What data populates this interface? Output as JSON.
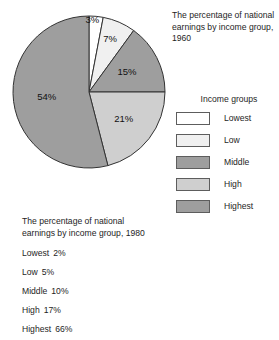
{
  "chart_data": {
    "type": "pie",
    "title": "The percentage of national earnings by income group, 1960",
    "categories": [
      "Lowest",
      "Low",
      "Middle",
      "High",
      "Highest"
    ],
    "values": [
      3,
      7,
      15,
      21,
      54
    ],
    "value_labels": [
      "3%",
      "7%",
      "15%",
      "21%",
      "54%"
    ],
    "unit": "%",
    "start_angle_deg": 0,
    "direction": "clockwise",
    "legend_position": "right",
    "grid": false,
    "colors": [
      "#ffffff",
      "#f0f0f0",
      "#9e9e9e",
      "#cfcfcf",
      "#9e9e9e"
    ],
    "stroke": "#333333",
    "companion_table": {
      "title": "The percentage of national earnings by income group, 1980",
      "type": "table",
      "categories": [
        "Lowest",
        "Low",
        "Middle",
        "High",
        "Highest"
      ],
      "values": [
        2,
        5,
        10,
        17,
        66
      ],
      "value_labels": [
        "2%",
        "5%",
        "10%",
        "17%",
        "66%"
      ]
    }
  },
  "pie": {
    "slices": [
      {
        "label": "3%",
        "value": 3,
        "color": "#ffffff",
        "group": "Lowest"
      },
      {
        "label": "7%",
        "value": 7,
        "color": "#f0f0f0",
        "group": "Low"
      },
      {
        "label": "15%",
        "value": 15,
        "color": "#9e9e9e",
        "group": "Middle"
      },
      {
        "label": "21%",
        "value": 21,
        "color": "#cfcfcf",
        "group": "High"
      },
      {
        "label": "54%",
        "value": 54,
        "color": "#9e9e9e",
        "group": "Highest"
      }
    ]
  },
  "caption_1960": {
    "line1": "The percentage of national",
    "line2": "earnings by income group,",
    "line3": "1960"
  },
  "legend": {
    "title": "Income groups",
    "items": [
      {
        "label": "Lowest",
        "color": "#ffffff"
      },
      {
        "label": "Low",
        "color": "#f0f0f0"
      },
      {
        "label": "Middle",
        "color": "#9e9e9e"
      },
      {
        "label": "High",
        "color": "#cfcfcf"
      },
      {
        "label": "Highest",
        "color": "#9e9e9e"
      }
    ]
  },
  "block_1980": {
    "caption_line1": "The percentage of national",
    "caption_line2": "earnings by income group, 1980",
    "stats": [
      {
        "label": "Lowest",
        "value": "2%"
      },
      {
        "label": "Low",
        "value": "5%"
      },
      {
        "label": "Middle",
        "value": "10%"
      },
      {
        "label": "High",
        "value": "17%"
      },
      {
        "label": "Highest",
        "value": "66%"
      }
    ]
  }
}
